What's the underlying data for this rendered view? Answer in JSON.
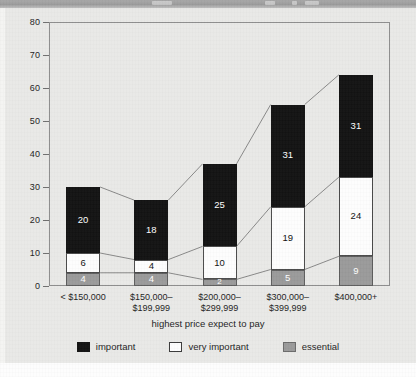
{
  "page": {
    "background_color": "#e9e9e7",
    "title_bar_color": "#9b9b9b"
  },
  "chart_data": {
    "type": "bar",
    "subtype": "stacked-bar",
    "title": "",
    "xlabel": "highest price expect to pay",
    "ylabel": "percent",
    "ylim": [
      0,
      80
    ],
    "yticks": [
      0,
      10,
      20,
      30,
      40,
      50,
      60,
      70,
      80
    ],
    "ytick_labels": [
      "0",
      "10",
      "20",
      "30",
      "40",
      "50",
      "60",
      "70",
      "80"
    ],
    "grid": false,
    "legend_position": "bottom",
    "categories": [
      "< $150,000",
      "$150,000–$199,999",
      "$200,000–$299,999",
      "$300,000–$399,999",
      "$400,000+"
    ],
    "category_lines": [
      [
        "< $150,000",
        ""
      ],
      [
        "$150,000–",
        "$199,999"
      ],
      [
        "$200,000–",
        "$299,999"
      ],
      [
        "$300,000–",
        "$399,999"
      ],
      [
        "$400,000+",
        ""
      ]
    ],
    "series": [
      {
        "name": "essential",
        "color": "#9a9a9a",
        "values": [
          4,
          4,
          2,
          5,
          9
        ]
      },
      {
        "name": "very important",
        "color": "#fdfdfd",
        "values": [
          6,
          4,
          10,
          19,
          24
        ]
      },
      {
        "name": "important",
        "color": "#121212",
        "values": [
          20,
          18,
          25,
          31,
          31
        ]
      }
    ],
    "totals": [
      30,
      26,
      37,
      55,
      64
    ],
    "stack_order_bottom_to_top": [
      "essential",
      "very important",
      "important"
    ],
    "connector_lines": true,
    "annotations": []
  },
  "legend": {
    "items": [
      {
        "label": "important",
        "color": "#121212"
      },
      {
        "label": "very important",
        "color": "#fdfdfd"
      },
      {
        "label": "essential",
        "color": "#9a9a9a"
      }
    ]
  }
}
